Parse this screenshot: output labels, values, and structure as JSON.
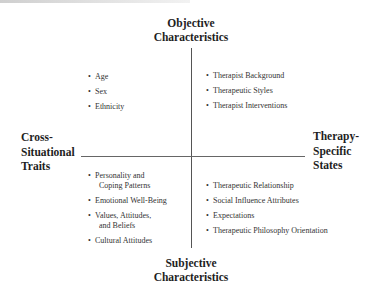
{
  "diagram": {
    "axes": {
      "top": [
        "Objective",
        "Characteristics"
      ],
      "bottom": [
        "Subjective",
        "Characteristics"
      ],
      "left": [
        "Cross-",
        "Situational",
        "Traits"
      ],
      "right": [
        "Therapy-",
        "Specific",
        "States"
      ]
    },
    "quadrants": {
      "top_left": [
        {
          "line1": "Age"
        },
        {
          "line1": "Sex"
        },
        {
          "line1": "Ethnicity"
        }
      ],
      "top_right": [
        {
          "line1": "Therapist Background"
        },
        {
          "line1": "Therapeutic Styles"
        },
        {
          "line1": "Therapist Interventions"
        }
      ],
      "bottom_left": [
        {
          "line1": "Personality and",
          "line2": "Coping Patterns"
        },
        {
          "line1": "Emotional Well-Being"
        },
        {
          "line1": "Values, Attitudes,",
          "line2": "and Beliefs"
        },
        {
          "line1": "Cultural Attitudes"
        }
      ],
      "bottom_right": [
        {
          "line1": "Therapeutic Relationship"
        },
        {
          "line1": "Social Influence Attributes"
        },
        {
          "line1": "Expectations"
        },
        {
          "line1": "Therapeutic Philosophy Orientation"
        }
      ]
    },
    "bullet": "•"
  }
}
